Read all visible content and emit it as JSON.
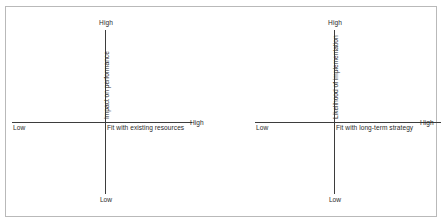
{
  "chart_data": [
    {
      "type": "scatter",
      "title": "",
      "xlabel": "Fit with existing resources",
      "ylabel": "Impact on performance",
      "x_low_label": "Low",
      "x_high_label": "High",
      "y_low_label": "Low",
      "y_high_label": "High",
      "series": [],
      "points": [],
      "grid": false,
      "legend": "none",
      "axis_style": "crossed-quadrant",
      "axis_color": "#3d3d3d"
    },
    {
      "type": "scatter",
      "title": "",
      "xlabel": "Fit with long-term strategy",
      "ylabel": "Likelihood of implementation",
      "x_low_label": "Low",
      "x_high_label": "High",
      "y_low_label": "Low",
      "y_high_label": "High",
      "series": [],
      "points": [],
      "grid": false,
      "legend": "none",
      "axis_style": "crossed-quadrant",
      "axis_color": "#3d3d3d"
    }
  ],
  "colors": {
    "background": "#ffffff",
    "frame_border": "#b9b9b9",
    "axis": "#3d3d3d",
    "text": "#2b2b2b"
  }
}
